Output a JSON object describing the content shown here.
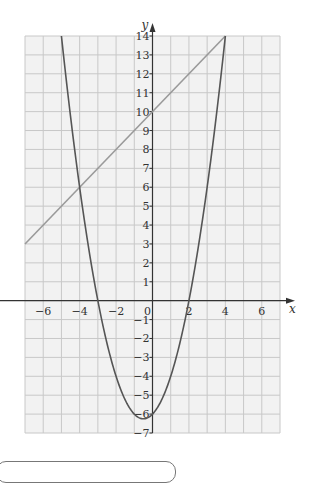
{
  "chart_data": {
    "type": "line",
    "title": "",
    "xlabel": "x",
    "ylabel": "y",
    "xlim": [
      -7,
      7
    ],
    "ylim": [
      -7,
      14
    ],
    "grid": true,
    "x_ticks": [
      -6,
      -4,
      -2,
      0,
      2,
      4,
      6
    ],
    "x_tick_labels": [
      "−6",
      "−4",
      "−2",
      "0",
      "2",
      "4",
      "6"
    ],
    "y_ticks": [
      -7,
      -6,
      -5,
      -4,
      -3,
      -2,
      -1,
      1,
      2,
      3,
      4,
      5,
      6,
      7,
      8,
      9,
      10,
      11,
      12,
      13,
      14
    ],
    "y_tick_labels": [
      "−7",
      "−6",
      "−5",
      "−4",
      "−3",
      "−2",
      "−1",
      "1",
      "2",
      "3",
      "4",
      "5",
      "6",
      "7",
      "8",
      "9",
      "10",
      "11",
      "12",
      "13",
      "14"
    ],
    "series": [
      {
        "name": "straight line",
        "equation": "y = x + 10",
        "x": [
          -7,
          4
        ],
        "y": [
          3,
          14
        ],
        "color": "#9a9a9a"
      },
      {
        "name": "parabola",
        "equation": "y = x^2 + x - 6",
        "x": [
          -5,
          -4,
          -3,
          -2,
          -1,
          -0.5,
          0,
          1,
          2,
          3,
          4
        ],
        "y": [
          14,
          6,
          0,
          -4,
          -6,
          -6.25,
          -6,
          -4,
          0,
          6,
          14
        ],
        "color": "#555555"
      }
    ],
    "intersections": [
      [
        -4,
        6
      ],
      [
        4,
        14
      ]
    ]
  },
  "colors": {
    "background": "#f2f2f2",
    "grid": "#c8c8c8",
    "axis": "#333333"
  }
}
